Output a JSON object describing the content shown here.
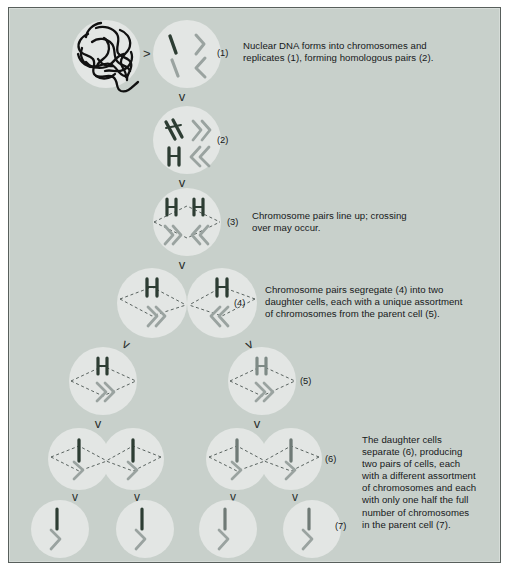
{
  "figure": {
    "panel": {
      "background_color": "#c8d0cb",
      "border_color": "#585f5c",
      "cell_fill_color": "#e3e6e4",
      "chromosome_dark_color": "#2d3d33",
      "chromosome_grey_color": "#9aa3a0",
      "dna_color": "#111111",
      "text_color": "#16181a"
    }
  },
  "captions": [
    {
      "id": "caption-1",
      "marker": "(1)",
      "lines": [
        "Nuclear DNA forms into chromosomes and",
        "replicates (1), forming homologous pairs (2)."
      ]
    },
    {
      "id": "caption-3",
      "marker": "(3)",
      "lines": [
        "Chromosome pairs line up; crossing",
        "over may occur."
      ]
    },
    {
      "id": "caption-4",
      "marker": "(4)",
      "lines": [
        "Chromosome pairs segregate (4) into two",
        "daughter cells, each with a unique assortment",
        "of chromosomes from the parent cell (5)."
      ]
    },
    {
      "id": "caption-7",
      "marker": "(7)",
      "lines": [
        "The daughter cells",
        "separate (6), producing",
        "two pairs of cells, each",
        "with a different assortment",
        "of chromosomes and each",
        "with only one half the full",
        "number of chromosomes",
        "in the parent cell (7)."
      ]
    }
  ],
  "step_markers": [
    {
      "id": "marker-1",
      "label": "(1)"
    },
    {
      "id": "marker-2",
      "label": "(2)"
    },
    {
      "id": "marker-3",
      "label": "(3)"
    },
    {
      "id": "marker-4",
      "label": "(4)"
    },
    {
      "id": "marker-5",
      "label": "(5)"
    },
    {
      "id": "marker-6",
      "label": "(6)"
    },
    {
      "id": "marker-7",
      "label": "(7)"
    }
  ],
  "stages": [
    {
      "id": "stage-0-nucleus",
      "name": "tangled-dna-nucleus",
      "description": "Cell containing tangled nuclear DNA",
      "cells": 1
    },
    {
      "id": "stage-1",
      "name": "chromosomes-formed",
      "description": "Four individual chromosomes: one dark, three grey",
      "cells": 1
    },
    {
      "id": "stage-2",
      "name": "replicated-homologous-pairs",
      "description": "Chromosomes replicated into doubled homologous pairs",
      "cells": 1
    },
    {
      "id": "stage-3",
      "name": "pairs-lined-up",
      "description": "Chromosome pairs lined up on the spindle; crossing over",
      "cells": 1
    },
    {
      "id": "stage-4",
      "name": "segregation",
      "description": "Chromosome pairs segregate into two daughter cells",
      "cells": 2
    },
    {
      "id": "stage-5",
      "name": "two-daughter-cells",
      "description": "Two separate daughter cells, each a unique assortment",
      "cells": 2
    },
    {
      "id": "stage-6",
      "name": "daughter-cells-divide",
      "description": "Each daughter cell divides again into two",
      "cells": 4
    },
    {
      "id": "stage-7",
      "name": "four-haploid-cells",
      "description": "Four cells each with half the chromosome number",
      "cells": 4
    }
  ],
  "arrows": {
    "chevron_down": "v",
    "chevron_right": ">"
  }
}
